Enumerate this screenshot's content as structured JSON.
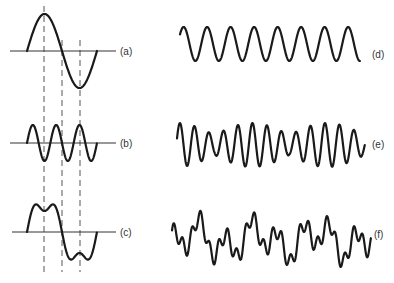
{
  "figure": {
    "panels": [
      {
        "id": "a",
        "label": "(a)",
        "kind": "fundamental sine, one cycle",
        "cycles": 1,
        "harmonic": 1
      },
      {
        "id": "b",
        "label": "(b)",
        "kind": "third harmonic sine",
        "cycles": 3,
        "harmonic": 3
      },
      {
        "id": "c",
        "label": "(c)",
        "kind": "sum of (a) and (b)",
        "components": [
          1,
          3
        ]
      },
      {
        "id": "d",
        "label": "(d)",
        "kind": "pure periodic sine",
        "cycles": 8
      },
      {
        "id": "e",
        "label": "(e)",
        "kind": "complex waveform, amplitude-modulated"
      },
      {
        "id": "f",
        "label": "(f)",
        "kind": "complex irregular waveform"
      }
    ],
    "dashed_guides": 3
  }
}
